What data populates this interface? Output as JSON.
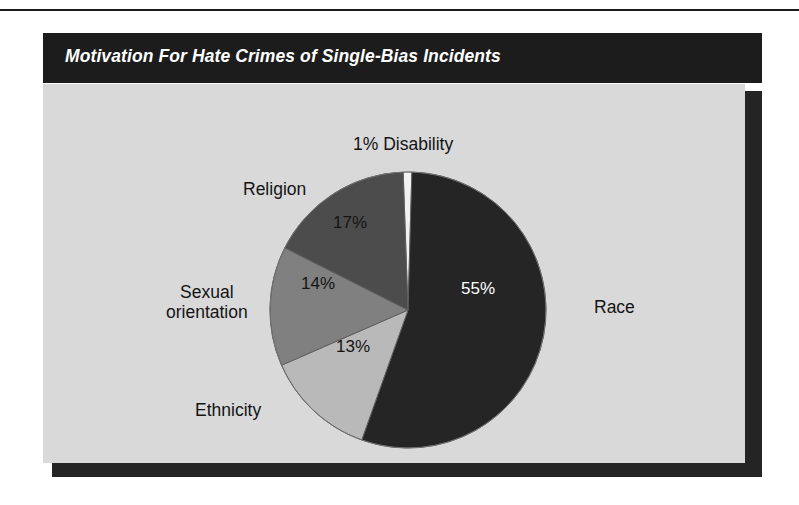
{
  "figure": {
    "title": "Motivation For Hate Crimes of Single-Bias Incidents",
    "panel_color": "#d9d9d9",
    "title_bar_color": "#1c1c1c",
    "title_text_color": "#ffffff"
  },
  "chart_data": {
    "type": "pie",
    "title": "Motivation For Hate Crimes of Single-Bias Incidents",
    "xlabel": "",
    "ylabel": "",
    "legend_position": "none",
    "grid": false,
    "categories": [
      "Race",
      "Ethnicity",
      "Sexual orientation",
      "Religion",
      "Disability"
    ],
    "values": [
      55,
      13,
      14,
      17,
      1
    ],
    "value_labels": [
      "55%",
      "13%",
      "14%",
      "17%",
      "1%"
    ],
    "slice_colors": [
      "#252525",
      "#b9b9b9",
      "#808080",
      "#4c4c4c",
      "#f2f2f2"
    ],
    "start_angle_deg": -2,
    "direction": "clockwise",
    "slices": [
      {
        "name": "Disability",
        "label": "1% Disability",
        "category": "Disability",
        "value_label": "1%",
        "value": 1,
        "color": "#f2f2f2",
        "label_position": "outside-top"
      },
      {
        "name": "Race",
        "label": "Race",
        "category": "Race",
        "value_label": "55%",
        "value": 55,
        "color": "#252525",
        "label_position": "outside-right"
      },
      {
        "name": "Ethnicity",
        "label": "Ethnicity",
        "category": "Ethnicity",
        "value_label": "13%",
        "value": 13,
        "color": "#b9b9b9",
        "label_position": "outside-bottom-left"
      },
      {
        "name": "Sexual orientation",
        "label_line1": "Sexual",
        "label_line2": "orientation",
        "category": "Sexual orientation",
        "value_label": "14%",
        "value": 14,
        "color": "#808080",
        "label_position": "outside-left"
      },
      {
        "name": "Religion",
        "label": "Religion",
        "category": "Religion",
        "value_label": "17%",
        "value": 17,
        "color": "#4c4c4c",
        "label_position": "outside-upper-left"
      }
    ]
  }
}
